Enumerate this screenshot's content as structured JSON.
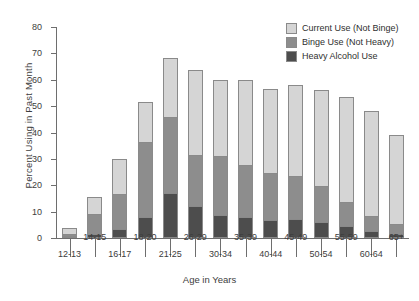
{
  "chart_data": {
    "type": "bar",
    "subtype": "stacked",
    "title": "",
    "xlabel": "Age in Years",
    "ylabel": "Percent Using in Past Month",
    "ylim": [
      0,
      80
    ],
    "yticks": [
      0,
      10,
      20,
      30,
      40,
      50,
      60,
      70,
      80
    ],
    "grid": false,
    "legend_position": "top-right",
    "categories": [
      "12-13",
      "14-15",
      "16-17",
      "18-20",
      "21-25",
      "26-29",
      "30-34",
      "35-39",
      "40-44",
      "45-49",
      "50-54",
      "55-59",
      "60-64",
      "65+"
    ],
    "series": [
      {
        "name": "Heavy Alcohol Use",
        "color": "#4d4d4d",
        "values": [
          0.6,
          1.4,
          3.3,
          8.0,
          17.0,
          12.3,
          8.6,
          7.8,
          6.9,
          7.3,
          5.9,
          4.6,
          2.8,
          1.4
        ]
      },
      {
        "name": "Binge Use (Not Heavy)",
        "color": "#8d8d8d",
        "values": [
          0.9,
          7.6,
          13.2,
          28.3,
          28.9,
          19.0,
          22.4,
          19.7,
          17.6,
          16.3,
          13.7,
          9.1,
          5.7,
          3.8
        ]
      },
      {
        "name": "Current Use (Not Binge)",
        "color": "#d5d5d5",
        "values": [
          2.0,
          6.5,
          13.5,
          15.2,
          22.3,
          32.3,
          29.0,
          32.5,
          32.0,
          34.4,
          36.4,
          39.7,
          39.5,
          33.8
        ]
      }
    ],
    "totals": [
      3.5,
      15.5,
      30.0,
      51.5,
      68.2,
      63.6,
      60.0,
      60.0,
      56.5,
      58.0,
      56.0,
      53.4,
      48.0,
      39.0
    ]
  },
  "legend": {
    "items": [
      {
        "label": "Current Use (Not Binge)",
        "color": "#d5d5d5"
      },
      {
        "label": "Binge Use (Not Heavy)",
        "color": "#8d8d8d"
      },
      {
        "label": "Heavy Alcohol Use",
        "color": "#4d4d4d"
      }
    ]
  },
  "axes": {
    "y_title": "Percent Using in Past Month",
    "x_title": "Age in Years"
  }
}
